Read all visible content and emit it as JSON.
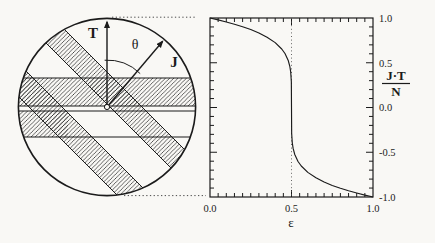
{
  "figure": {
    "background": "#f9f8f5",
    "ink": "#1b1b1b",
    "hatch_color": "#2e2e2e"
  },
  "diagram": {
    "label_T": "T",
    "label_J": "J",
    "label_theta": "θ"
  },
  "chart": {
    "ylabel_numerator": "J·T",
    "ylabel_denominator": "N",
    "xlabel": "ε"
  },
  "chart_data": {
    "type": "line",
    "title": "",
    "xlabel": "ε",
    "ylabel": "J·T/N",
    "xlim": [
      0,
      1
    ],
    "ylim": [
      -1,
      1
    ],
    "grid": false,
    "x_major_ticks": [
      0,
      0.5,
      1
    ],
    "x_major_labels": [
      "0.0",
      "0.5",
      "1.0"
    ],
    "x_minor_step": 0.05,
    "y_major_ticks": [
      1,
      0.5,
      0,
      -0.5,
      -1
    ],
    "y_major_labels": [
      "1.0",
      "0.5",
      "0.0",
      "-0.5",
      "-1.0"
    ],
    "y_minor_step": 0.1,
    "reference_line_x": 0.5,
    "series": [
      {
        "name": "J·T/N",
        "points": [
          [
            0,
            1.0
          ],
          [
            0.05,
            0.979
          ],
          [
            0.1,
            0.956
          ],
          [
            0.15,
            0.931
          ],
          [
            0.2,
            0.903
          ],
          [
            0.25,
            0.871
          ],
          [
            0.3,
            0.833
          ],
          [
            0.35,
            0.786
          ],
          [
            0.4,
            0.725
          ],
          [
            0.44,
            0.654
          ],
          [
            0.46,
            0.603
          ],
          [
            0.48,
            0.525
          ],
          [
            0.49,
            0.457
          ],
          [
            0.495,
            0.398
          ],
          [
            0.499,
            0.289
          ],
          [
            0.5,
            0.0
          ],
          [
            0.501,
            -0.289
          ],
          [
            0.505,
            -0.398
          ],
          [
            0.51,
            -0.457
          ],
          [
            0.52,
            -0.525
          ],
          [
            0.54,
            -0.603
          ],
          [
            0.56,
            -0.654
          ],
          [
            0.6,
            -0.725
          ],
          [
            0.65,
            -0.786
          ],
          [
            0.7,
            -0.833
          ],
          [
            0.75,
            -0.871
          ],
          [
            0.8,
            -0.903
          ],
          [
            0.85,
            -0.931
          ],
          [
            0.9,
            -0.956
          ],
          [
            0.95,
            -0.979
          ],
          [
            1,
            -1.0
          ]
        ]
      }
    ]
  }
}
